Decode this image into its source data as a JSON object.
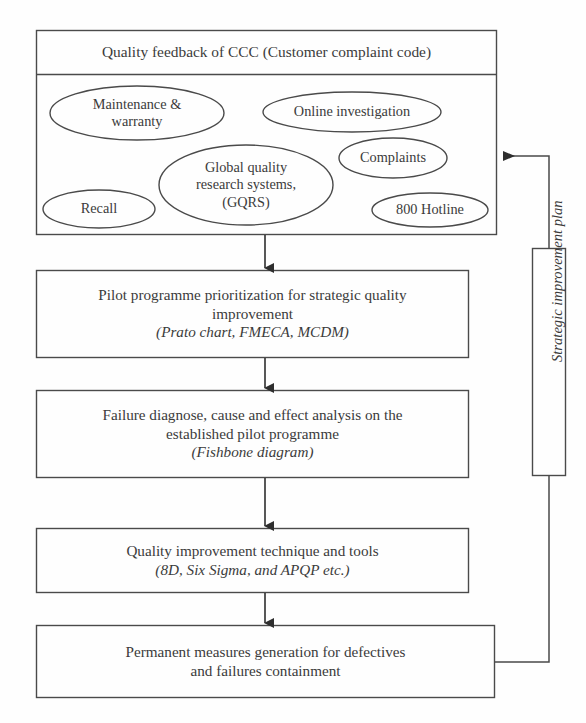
{
  "diagram": {
    "colors": {
      "stroke": "#4a4a4a",
      "text": "#3b3b3b",
      "background": "#fefefe",
      "arrow_fill": "#2e2e2e"
    }
  },
  "top_container": {
    "header": "Quality feedback of CCC (Customer complaint code)",
    "sources": [
      {
        "id": "maintenance-warranty",
        "lines": [
          "Maintenance &",
          "warranty"
        ]
      },
      {
        "id": "online-investigation",
        "lines": [
          "Online investigation"
        ]
      },
      {
        "id": "global-quality-research-systems",
        "lines": [
          "Global quality",
          "research systems,",
          "(GQRS)"
        ]
      },
      {
        "id": "complaints",
        "lines": [
          "Complaints"
        ]
      },
      {
        "id": "recall",
        "lines": [
          "Recall"
        ]
      },
      {
        "id": "hotline-800",
        "lines": [
          "800 Hotline"
        ]
      }
    ]
  },
  "steps": [
    {
      "id": "pilot-programme-prioritization",
      "lines": [
        "Pilot programme prioritization for strategic quality",
        "improvement"
      ],
      "methods": "(Prato chart, FMECA, MCDM)"
    },
    {
      "id": "failure-diagnose",
      "lines": [
        "Failure diagnose, cause and effect analysis on the",
        "established pilot programme"
      ],
      "methods": "(Fishbone diagram)"
    },
    {
      "id": "quality-improvement-technique",
      "lines": [
        "Quality improvement technique and tools"
      ],
      "methods": "(8D, Six Sigma, and APQP etc.)"
    },
    {
      "id": "permanent-measures",
      "lines": [
        "Permanent measures generation for defectives",
        "and failures containment"
      ],
      "methods": ""
    }
  ],
  "feedback_loop": {
    "label": "Strategic improvement plan"
  }
}
